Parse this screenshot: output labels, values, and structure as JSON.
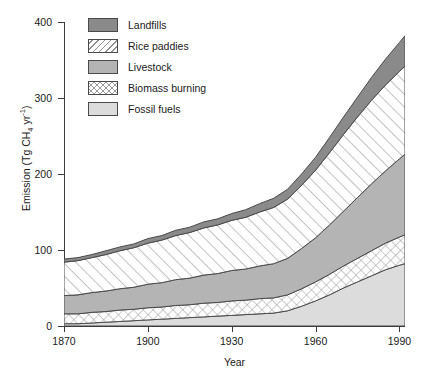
{
  "chart_data": {
    "type": "area",
    "stacked": true,
    "title": "",
    "xlabel": "Year",
    "ylabel": "Emission (Tg CH4 yr-1)",
    "ylabel_parts": {
      "prefix": "Emission (Tg CH",
      "sub": "4",
      "mid": " yr",
      "sup": "-1",
      "suffix": ")"
    },
    "xlim": [
      1870,
      1992
    ],
    "ylim": [
      0,
      400
    ],
    "grid": false,
    "legend_position": "top-left-inside",
    "xticks": [
      1870,
      1900,
      1930,
      1960,
      1990
    ],
    "xtick_labels": [
      "1870",
      "1900",
      "1930",
      "1960",
      "1990"
    ],
    "yticks": [
      0,
      100,
      200,
      300,
      400
    ],
    "ytick_labels": [
      "0",
      "100",
      "200",
      "300",
      "400"
    ],
    "x": [
      1870,
      1875,
      1880,
      1885,
      1890,
      1895,
      1900,
      1905,
      1910,
      1915,
      1920,
      1925,
      1930,
      1935,
      1940,
      1945,
      1950,
      1955,
      1960,
      1965,
      1970,
      1975,
      1980,
      1985,
      1990,
      1992
    ],
    "series": [
      {
        "name": "Fossil fuels",
        "pattern": "solid",
        "color": "#dcdcdc",
        "values": [
          3,
          3,
          4,
          5,
          6,
          7,
          8,
          9,
          10,
          11,
          12,
          13,
          14,
          15,
          16,
          17,
          20,
          26,
          33,
          41,
          50,
          58,
          66,
          74,
          80,
          82
        ]
      },
      {
        "name": "Biomass burning",
        "pattern": "crosshatch",
        "color": "#ffffff",
        "values": [
          13,
          13,
          14,
          14,
          15,
          15,
          16,
          16,
          17,
          17,
          18,
          18,
          19,
          19,
          20,
          20,
          21,
          23,
          25,
          27,
          29,
          31,
          33,
          35,
          37,
          38
        ]
      },
      {
        "name": "Livestock",
        "pattern": "solid",
        "color": "#b4b4b4",
        "values": [
          24,
          25,
          26,
          27,
          28,
          29,
          31,
          32,
          34,
          35,
          37,
          38,
          40,
          41,
          43,
          45,
          48,
          53,
          58,
          65,
          72,
          80,
          88,
          95,
          103,
          106
        ]
      },
      {
        "name": "Rice paddies",
        "pattern": "diagonal",
        "color": "#ffffff",
        "values": [
          44,
          45,
          46,
          48,
          50,
          52,
          54,
          56,
          58,
          60,
          62,
          64,
          66,
          68,
          71,
          74,
          78,
          83,
          89,
          95,
          101,
          106,
          110,
          113,
          115,
          116
        ]
      },
      {
        "name": "Landfills",
        "pattern": "solid",
        "color": "#8a8a8a",
        "values": [
          4,
          4,
          4,
          5,
          5,
          5,
          6,
          6,
          7,
          7,
          8,
          8,
          9,
          10,
          11,
          12,
          13,
          15,
          17,
          20,
          23,
          26,
          30,
          34,
          38,
          40
        ]
      }
    ],
    "totals": [
      88,
      90,
      94,
      99,
      104,
      108,
      115,
      119,
      126,
      130,
      137,
      141,
      148,
      153,
      161,
      168,
      180,
      200,
      222,
      248,
      275,
      301,
      327,
      351,
      373,
      382
    ]
  },
  "legend": {
    "items": [
      {
        "label": "Landfills",
        "swatch": "sw-landfills",
        "icon": "legend-swatch-solid-dark"
      },
      {
        "label": "Rice paddies",
        "swatch": "sw-rice",
        "icon": "legend-swatch-diagonal"
      },
      {
        "label": "Livestock",
        "swatch": "sw-livestock",
        "icon": "legend-swatch-solid-medium"
      },
      {
        "label": "Biomass burning",
        "swatch": "sw-biomass",
        "icon": "legend-swatch-crosshatch"
      },
      {
        "label": "Fossil fuels",
        "swatch": "sw-fossil",
        "icon": "legend-swatch-solid-light"
      }
    ]
  },
  "colors": {
    "landfills": "#8a8a8a",
    "livestock": "#b4b4b4",
    "fossil_fuels": "#dcdcdc",
    "rice_paddies": "#ffffff",
    "biomass_burning": "#ffffff",
    "axis": "#3c3c3c",
    "outline": "#4a4a4a",
    "background": "#ffffff"
  }
}
